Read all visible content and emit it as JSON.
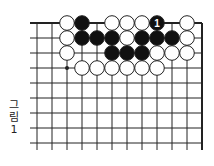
{
  "figure": {
    "caption_lines": [
      "그",
      "림",
      "1"
    ],
    "caption": "그림 1"
  },
  "board": {
    "origin_x": 37,
    "origin_y": 23,
    "spacing": 15,
    "columns": 12,
    "rows": 9,
    "line_left_extend": 7,
    "line_bottom_extend": 7,
    "edges": {
      "top": true,
      "right": true,
      "left": false,
      "bottom": false
    },
    "star_points": [
      {
        "col": 2,
        "row": 3
      }
    ],
    "colors": {
      "line": "#222222",
      "black_stone": "#111111",
      "white_stone": "#ffffff",
      "stone_stroke": "#222222",
      "label_on_black": "#ffffff"
    },
    "stones": [
      {
        "col": 2,
        "row": 0,
        "color": "white"
      },
      {
        "col": 3,
        "row": 0,
        "color": "black"
      },
      {
        "col": 5,
        "row": 0,
        "color": "white"
      },
      {
        "col": 6,
        "row": 0,
        "color": "white"
      },
      {
        "col": 7,
        "row": 0,
        "color": "white"
      },
      {
        "col": 8,
        "row": 0,
        "color": "black",
        "label": "1"
      },
      {
        "col": 10,
        "row": 0,
        "color": "white"
      },
      {
        "col": 2,
        "row": 1,
        "color": "white"
      },
      {
        "col": 3,
        "row": 1,
        "color": "black"
      },
      {
        "col": 4,
        "row": 1,
        "color": "black"
      },
      {
        "col": 5,
        "row": 1,
        "color": "black"
      },
      {
        "col": 6,
        "row": 1,
        "color": "white"
      },
      {
        "col": 7,
        "row": 1,
        "color": "black"
      },
      {
        "col": 8,
        "row": 1,
        "color": "black"
      },
      {
        "col": 9,
        "row": 1,
        "color": "black"
      },
      {
        "col": 10,
        "row": 1,
        "color": "white"
      },
      {
        "col": 2,
        "row": 2,
        "color": "white"
      },
      {
        "col": 5,
        "row": 2,
        "color": "black"
      },
      {
        "col": 6,
        "row": 2,
        "color": "black"
      },
      {
        "col": 7,
        "row": 2,
        "color": "black"
      },
      {
        "col": 8,
        "row": 2,
        "color": "white"
      },
      {
        "col": 9,
        "row": 2,
        "color": "white"
      },
      {
        "col": 10,
        "row": 2,
        "color": "white"
      },
      {
        "col": 3,
        "row": 3,
        "color": "white"
      },
      {
        "col": 4,
        "row": 3,
        "color": "white"
      },
      {
        "col": 5,
        "row": 3,
        "color": "white"
      },
      {
        "col": 6,
        "row": 3,
        "color": "white"
      },
      {
        "col": 7,
        "row": 3,
        "color": "white"
      },
      {
        "col": 8,
        "row": 3,
        "color": "white"
      }
    ]
  }
}
